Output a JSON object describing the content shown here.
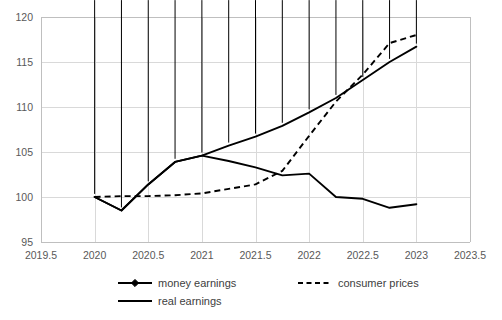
{
  "chart_data": {
    "type": "line",
    "title": "",
    "xlabel": "",
    "ylabel": "",
    "xlim": [
      2019.5,
      2023.5
    ],
    "ylim": [
      95,
      120
    ],
    "x_ticks": [
      "2019.5",
      "2020",
      "2020.5",
      "2021",
      "2021.5",
      "2022",
      "2022.5",
      "2023",
      "2023.5"
    ],
    "x_tick_values": [
      2019.5,
      2020,
      2020.5,
      2021,
      2021.5,
      2022,
      2022.5,
      2023,
      2023.5
    ],
    "y_ticks": [
      "95",
      "100",
      "105",
      "110",
      "115",
      "120"
    ],
    "y_tick_values": [
      95,
      100,
      105,
      110,
      115,
      120
    ],
    "grid": true,
    "legend_position": "bottom",
    "series": [
      {
        "name": "money earnings",
        "style": "solid-with-diamond-markers",
        "x": [
          2020,
          2020.25,
          2020.5,
          2020.75,
          2021,
          2021.25,
          2021.5,
          2021.75,
          2022,
          2022.25,
          2022.5,
          2022.75,
          2023
        ],
        "values": [
          100.0,
          98.5,
          101.4,
          103.9,
          104.6,
          105.7,
          106.7,
          107.9,
          109.4,
          111.0,
          113.0,
          115.0,
          116.7
        ]
      },
      {
        "name": "consumer prices",
        "style": "dashed",
        "x": [
          2020,
          2020.25,
          2020.5,
          2020.75,
          2021,
          2021.25,
          2021.5,
          2021.75,
          2022,
          2022.25,
          2022.5,
          2022.75,
          2023
        ],
        "values": [
          100.0,
          100.1,
          100.1,
          100.2,
          100.4,
          100.9,
          101.4,
          102.9,
          106.8,
          110.6,
          113.6,
          117.1,
          118.0
        ]
      },
      {
        "name": "real earnings",
        "style": "solid",
        "x": [
          2020,
          2020.25,
          2020.5,
          2020.75,
          2021,
          2021.25,
          2021.5,
          2021.75,
          2022,
          2022.25,
          2022.5,
          2022.75,
          2023
        ],
        "values": [
          100.0,
          98.5,
          101.4,
          103.9,
          104.6,
          104.0,
          103.3,
          102.4,
          102.6,
          100.0,
          99.8,
          98.8,
          99.2
        ]
      }
    ]
  },
  "legend": {
    "items": [
      {
        "label": "money earnings",
        "marker": "diamond",
        "dash": false
      },
      {
        "label": "consumer prices",
        "marker": "none",
        "dash": true
      },
      {
        "label": "real earnings",
        "marker": "none",
        "dash": false
      }
    ]
  },
  "colors": {
    "line": "#000000",
    "grid": "#d9d9d9",
    "axis": "#bfbfbf",
    "tick_text": "#595959",
    "legend_text": "#404040",
    "background": "#ffffff"
  }
}
